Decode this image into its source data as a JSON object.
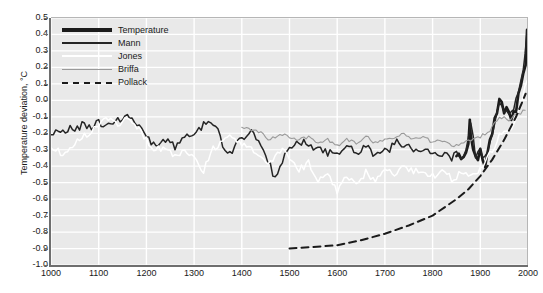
{
  "chart_data": {
    "type": "line",
    "title": "",
    "xlabel": "",
    "ylabel": "Temperature deviation, °C",
    "xlim": [
      1000,
      2000
    ],
    "ylim": [
      -1.0,
      0.5
    ],
    "grid": true,
    "legend_position": "top-left",
    "x_ticks": [
      "1000",
      "1100",
      "1200",
      "1300",
      "1400",
      "1500",
      "1600",
      "1700",
      "1800",
      "1900",
      "2000"
    ],
    "y_ticks": [
      "0.5",
      "0.4",
      "0.3",
      "0.2",
      "0.1",
      "0.0",
      "-0.1",
      "-0.2",
      "-0.3",
      "-0.4",
      "-0.5",
      "-0.6",
      "-0.7",
      "-0.8",
      "-0.9",
      "-1.0"
    ],
    "series": [
      {
        "name": "Temperature",
        "style": "solid-thick",
        "color": "#1b1b1b",
        "width": 2.6,
        "x": [
          1850,
          1855,
          1860,
          1865,
          1870,
          1875,
          1878,
          1880,
          1885,
          1890,
          1895,
          1900,
          1905,
          1910,
          1915,
          1920,
          1925,
          1930,
          1935,
          1940,
          1945,
          1950,
          1955,
          1960,
          1965,
          1970,
          1975,
          1980,
          1985,
          1990,
          1995,
          1998,
          2000
        ],
        "values": [
          -0.33,
          -0.31,
          -0.34,
          -0.35,
          -0.3,
          -0.28,
          -0.12,
          -0.22,
          -0.32,
          -0.36,
          -0.35,
          -0.3,
          -0.38,
          -0.4,
          -0.3,
          -0.22,
          -0.2,
          -0.12,
          -0.1,
          0.02,
          -0.02,
          -0.08,
          -0.05,
          -0.08,
          -0.12,
          -0.05,
          -0.08,
          0.06,
          0.08,
          0.18,
          0.22,
          0.45,
          0.4
        ]
      },
      {
        "name": "Mann",
        "style": "solid-medium",
        "color": "#242424",
        "width": 1.5,
        "x": [
          1000,
          1010,
          1020,
          1030,
          1040,
          1050,
          1060,
          1070,
          1080,
          1090,
          1100,
          1110,
          1120,
          1130,
          1140,
          1150,
          1160,
          1170,
          1180,
          1190,
          1200,
          1210,
          1220,
          1230,
          1240,
          1250,
          1260,
          1270,
          1280,
          1290,
          1300,
          1310,
          1320,
          1330,
          1340,
          1350,
          1360,
          1370,
          1380,
          1390,
          1400,
          1410,
          1420,
          1430,
          1440,
          1450,
          1460,
          1470,
          1480,
          1490,
          1500,
          1510,
          1520,
          1530,
          1540,
          1550,
          1560,
          1570,
          1580,
          1590,
          1600,
          1610,
          1620,
          1630,
          1640,
          1650,
          1660,
          1670,
          1680,
          1690,
          1700,
          1710,
          1720,
          1730,
          1740,
          1750,
          1760,
          1770,
          1780,
          1790,
          1800,
          1810,
          1820,
          1830,
          1840,
          1850,
          1860,
          1870,
          1880,
          1890,
          1900,
          1910,
          1920,
          1930,
          1940,
          1950,
          1960,
          1970,
          1980,
          1990,
          1998
        ],
        "values": [
          -0.2,
          -0.19,
          -0.21,
          -0.18,
          -0.17,
          -0.19,
          -0.16,
          -0.14,
          -0.17,
          -0.15,
          -0.13,
          -0.15,
          -0.12,
          -0.14,
          -0.12,
          -0.11,
          -0.1,
          -0.12,
          -0.15,
          -0.18,
          -0.22,
          -0.25,
          -0.27,
          -0.26,
          -0.24,
          -0.26,
          -0.28,
          -0.25,
          -0.22,
          -0.21,
          -0.2,
          -0.18,
          -0.14,
          -0.12,
          -0.13,
          -0.15,
          -0.28,
          -0.34,
          -0.3,
          -0.26,
          -0.22,
          -0.24,
          -0.2,
          -0.22,
          -0.26,
          -0.32,
          -0.4,
          -0.48,
          -0.42,
          -0.34,
          -0.28,
          -0.26,
          -0.27,
          -0.25,
          -0.28,
          -0.3,
          -0.28,
          -0.3,
          -0.32,
          -0.3,
          -0.34,
          -0.3,
          -0.28,
          -0.3,
          -0.32,
          -0.3,
          -0.28,
          -0.31,
          -0.33,
          -0.3,
          -0.28,
          -0.3,
          -0.26,
          -0.24,
          -0.28,
          -0.26,
          -0.29,
          -0.3,
          -0.32,
          -0.3,
          -0.33,
          -0.31,
          -0.34,
          -0.32,
          -0.35,
          -0.33,
          -0.34,
          -0.3,
          -0.12,
          -0.34,
          -0.3,
          -0.36,
          -0.24,
          -0.14,
          -0.02,
          -0.06,
          -0.08,
          -0.06,
          0.06,
          0.18,
          0.42
        ]
      },
      {
        "name": "Jones",
        "style": "solid-thin",
        "color": "#ffffff",
        "width": 1.5,
        "x": [
          1000,
          1020,
          1040,
          1060,
          1080,
          1100,
          1120,
          1140,
          1160,
          1180,
          1200,
          1220,
          1240,
          1260,
          1280,
          1300,
          1320,
          1340,
          1360,
          1380,
          1400,
          1420,
          1440,
          1460,
          1480,
          1500,
          1520,
          1540,
          1560,
          1580,
          1600,
          1620,
          1640,
          1660,
          1680,
          1700,
          1720,
          1740,
          1760,
          1780,
          1800,
          1820,
          1840,
          1860,
          1880,
          1900,
          1920,
          1940,
          1960,
          1980,
          1998
        ],
        "values": [
          -0.28,
          -0.32,
          -0.3,
          -0.24,
          -0.2,
          -0.14,
          -0.12,
          -0.14,
          -0.1,
          -0.16,
          -0.24,
          -0.3,
          -0.28,
          -0.34,
          -0.3,
          -0.36,
          -0.42,
          -0.3,
          -0.24,
          -0.22,
          -0.26,
          -0.3,
          -0.34,
          -0.38,
          -0.3,
          -0.34,
          -0.42,
          -0.38,
          -0.48,
          -0.44,
          -0.55,
          -0.46,
          -0.52,
          -0.44,
          -0.5,
          -0.42,
          -0.46,
          -0.4,
          -0.44,
          -0.42,
          -0.46,
          -0.42,
          -0.48,
          -0.44,
          -0.46,
          -0.42,
          -0.32,
          -0.22,
          -0.2,
          -0.08,
          0.12
        ]
      },
      {
        "name": "Briffa",
        "style": "solid-thin",
        "color": "#9a9a9a",
        "width": 1.1,
        "x": [
          1400,
          1420,
          1440,
          1460,
          1480,
          1500,
          1520,
          1540,
          1560,
          1580,
          1600,
          1620,
          1640,
          1660,
          1680,
          1700,
          1720,
          1740,
          1760,
          1780,
          1800,
          1820,
          1840,
          1860,
          1880,
          1900,
          1920,
          1940,
          1960,
          1980,
          1994
        ],
        "values": [
          -0.16,
          -0.18,
          -0.2,
          -0.24,
          -0.2,
          -0.22,
          -0.24,
          -0.22,
          -0.26,
          -0.24,
          -0.28,
          -0.24,
          -0.26,
          -0.22,
          -0.26,
          -0.24,
          -0.22,
          -0.2,
          -0.24,
          -0.22,
          -0.26,
          -0.24,
          -0.28,
          -0.26,
          -0.24,
          -0.22,
          -0.18,
          -0.1,
          -0.12,
          -0.08,
          -0.06
        ]
      },
      {
        "name": "Pollack",
        "style": "dashed",
        "color": "#1b1b1b",
        "width": 2.0,
        "x": [
          1500,
          1550,
          1600,
          1650,
          1700,
          1750,
          1800,
          1850,
          1875,
          1900,
          1925,
          1950,
          1975,
          1995
        ],
        "values": [
          -0.9,
          -0.89,
          -0.88,
          -0.85,
          -0.81,
          -0.76,
          -0.7,
          -0.6,
          -0.54,
          -0.46,
          -0.36,
          -0.24,
          -0.1,
          0.04
        ]
      }
    ]
  },
  "legend": {
    "items": [
      {
        "label": "Temperature",
        "swatch": "sw-temperature"
      },
      {
        "label": "Mann",
        "swatch": "sw-mann"
      },
      {
        "label": "Jones",
        "swatch": "sw-jones"
      },
      {
        "label": "Briffa",
        "swatch": "sw-briffa"
      },
      {
        "label": "Pollack",
        "swatch": "sw-pollack"
      }
    ]
  },
  "colors": {
    "plot_background": "#e9e9e9",
    "gridline": "#ffffff",
    "axis": "#6e6e6e",
    "page_background": "#ffffff"
  }
}
